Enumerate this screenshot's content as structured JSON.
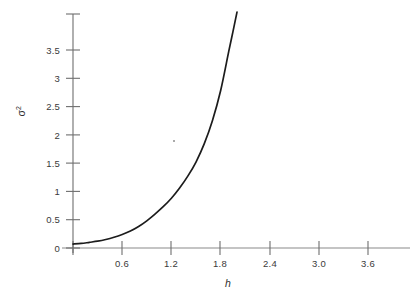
{
  "figure": {
    "background_color": "#ffffff",
    "curve_color": "#1c1c1c",
    "axis_color": "#6e6e6e",
    "text_color": "#3a3a3a"
  },
  "axes": {
    "x_title": "h",
    "y_title_base": "σ",
    "y_title_exponent": "2",
    "x_ticks": [
      "0.6",
      "1.2",
      "1.8",
      "2.4",
      "3.0",
      "3.6"
    ],
    "y_ticks": [
      "0",
      "0.5",
      "1",
      "1.5",
      "2",
      "2.5",
      "3",
      "3.5"
    ]
  },
  "chart_data": {
    "type": "line",
    "title": "",
    "xlabel": "h",
    "ylabel": "σ²",
    "xlim": [
      0,
      4.0
    ],
    "ylim": [
      0,
      4.2
    ],
    "xticks": [
      0.6,
      1.2,
      1.8,
      2.4,
      3.0,
      3.6
    ],
    "yticks": [
      0,
      0.5,
      1,
      1.5,
      2,
      2.5,
      3,
      3.5
    ],
    "grid": false,
    "legend": null,
    "series": [
      {
        "name": "variance",
        "x": [
          0.0,
          0.1,
          0.2,
          0.3,
          0.4,
          0.5,
          0.6,
          0.7,
          0.8,
          0.9,
          1.0,
          1.1,
          1.2,
          1.3,
          1.4,
          1.5,
          1.6,
          1.7,
          1.8,
          1.9,
          1.95,
          2.0
        ],
        "y": [
          0.07,
          0.08,
          0.1,
          0.12,
          0.15,
          0.19,
          0.24,
          0.3,
          0.38,
          0.48,
          0.6,
          0.73,
          0.88,
          1.06,
          1.27,
          1.52,
          1.84,
          2.25,
          2.78,
          3.48,
          3.82,
          4.17
        ]
      }
    ]
  }
}
